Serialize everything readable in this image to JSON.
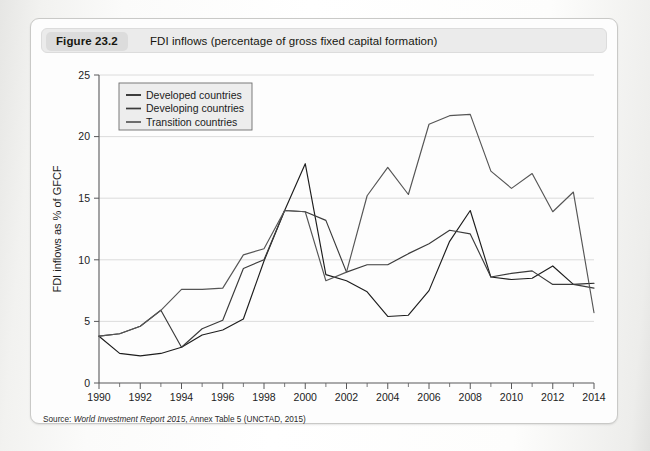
{
  "figure": {
    "badge": "Figure 23.2",
    "title": "FDI inflows (percentage of gross fixed capital formation)",
    "source_prefix": "Source: ",
    "source_italic": "World Investment Report 2015",
    "source_rest": ", Annex Table 5 (UNCTAD, 2015)"
  },
  "colors": {
    "developed": "#1d1d1d",
    "developing": "#3b3b3b",
    "transition": "#555555",
    "grid": "#d8d8d8",
    "axis": "#58585a",
    "card_bg": "#fdfdfd",
    "caption_bg": "#ebebeb",
    "badge_bg": "#dcdcdc"
  },
  "chart_data": {
    "type": "line",
    "title": "FDI inflows (percentage of gross fixed capital formation)",
    "xlabel": "",
    "ylabel": "FDI inflows as % of GFCF",
    "xlim": [
      1990,
      2014
    ],
    "ylim": [
      0,
      25
    ],
    "yticks": [
      0,
      5,
      10,
      15,
      20,
      25
    ],
    "xticks": [
      1990,
      1992,
      1994,
      1996,
      1998,
      2000,
      2002,
      2004,
      2006,
      2008,
      2010,
      2012,
      2014
    ],
    "minor_xticks_every": 1,
    "grid": true,
    "legend_position": "top-left",
    "x": [
      1990,
      1991,
      1992,
      1993,
      1994,
      1995,
      1996,
      1997,
      1998,
      1999,
      2000,
      2001,
      2002,
      2003,
      2004,
      2005,
      2006,
      2007,
      2008,
      2009,
      2010,
      2011,
      2012,
      2013,
      2014
    ],
    "series": [
      {
        "name": "Developed countries",
        "color": "#1d1d1d",
        "values": [
          3.8,
          2.4,
          2.2,
          2.4,
          2.9,
          3.9,
          4.3,
          5.2,
          9.9,
          14.0,
          17.8,
          8.8,
          8.3,
          7.4,
          5.4,
          5.5,
          7.5,
          11.5,
          14.0,
          8.6,
          8.4,
          8.5,
          9.5,
          8.0,
          8.1
        ]
      },
      {
        "name": "Developing countries",
        "color": "#3b3b3b",
        "values": [
          3.8,
          4.0,
          4.6,
          5.9,
          2.9,
          4.4,
          5.1,
          9.3,
          10.0,
          14.0,
          13.9,
          13.2,
          9.0,
          9.6,
          9.6,
          10.5,
          11.3,
          12.4,
          12.1,
          8.6,
          8.9,
          9.1,
          8.0,
          8.0,
          7.7
        ]
      },
      {
        "name": "Transition countries",
        "color": "#555555",
        "values": [
          3.8,
          4.0,
          4.6,
          5.9,
          7.6,
          7.6,
          7.7,
          10.4,
          10.9,
          14.0,
          13.9,
          8.3,
          9.0,
          15.2,
          17.5,
          15.3,
          21.0,
          21.7,
          21.8,
          17.2,
          15.8,
          17.0,
          13.9,
          15.5,
          5.7
        ]
      }
    ]
  }
}
